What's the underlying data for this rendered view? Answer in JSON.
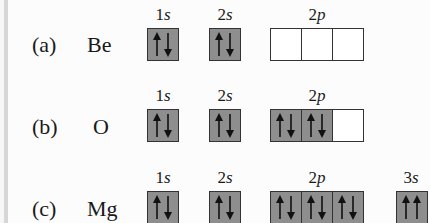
{
  "diagram": {
    "type": "orbital-box-diagram",
    "rows": [
      {
        "tag": "(a)",
        "element": "Be",
        "subshells": [
          {
            "label_num": "1",
            "label_let": "s",
            "boxes": [
              "updown"
            ]
          },
          {
            "label_num": "2",
            "label_let": "s",
            "boxes": [
              "updown"
            ]
          },
          {
            "label_num": "2",
            "label_let": "p",
            "boxes": [
              "empty",
              "empty",
              "empty"
            ]
          }
        ]
      },
      {
        "tag": "(b)",
        "element": "O",
        "subshells": [
          {
            "label_num": "1",
            "label_let": "s",
            "boxes": [
              "updown"
            ]
          },
          {
            "label_num": "2",
            "label_let": "s",
            "boxes": [
              "updown"
            ]
          },
          {
            "label_num": "2",
            "label_let": "p",
            "boxes": [
              "updown",
              "updown",
              "empty"
            ]
          }
        ]
      },
      {
        "tag": "(c)",
        "element": "Mg",
        "subshells": [
          {
            "label_num": "1",
            "label_let": "s",
            "boxes": [
              "updown"
            ]
          },
          {
            "label_num": "2",
            "label_let": "s",
            "boxes": [
              "updown"
            ]
          },
          {
            "label_num": "2",
            "label_let": "p",
            "boxes": [
              "updown",
              "updown",
              "updown"
            ]
          },
          {
            "label_num": "3",
            "label_let": "s",
            "boxes": [
              "upup"
            ]
          }
        ]
      }
    ],
    "colors": {
      "filled_box": "#8e8e8e",
      "empty_box": "#ffffff",
      "border": "#333333",
      "arrow": "#111111"
    }
  }
}
